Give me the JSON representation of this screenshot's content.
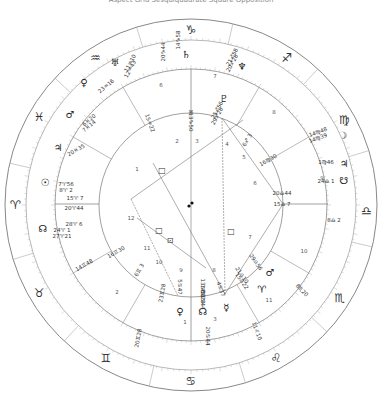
{
  "title": "Aspect Grid Sesquiquadrate Square Opposition",
  "center": {
    "x": 191,
    "y": 205
  },
  "radii": {
    "outer": 186,
    "zodiac_inner": 165,
    "house_outer": 136,
    "house_inner": 92
  },
  "colors": {
    "ring": "#888888",
    "tick": "#aaaaaa",
    "line": "#777777",
    "text": "#333333"
  },
  "signs": [
    {
      "glyph": "♑",
      "name": "capricorn",
      "angle": 90
    },
    {
      "glyph": "♐",
      "name": "sagittarius",
      "angle": 57
    },
    {
      "glyph": "♍",
      "name": "virgo",
      "angle": 29
    },
    {
      "glyph": "♎",
      "name": "libra",
      "angle": -2
    },
    {
      "glyph": "♏",
      "name": "scorpio",
      "angle": -32
    },
    {
      "glyph": "♌",
      "name": "leo",
      "angle": -61
    },
    {
      "glyph": "♋",
      "name": "cancer",
      "angle": -90
    },
    {
      "glyph": "♊",
      "name": "gemini",
      "angle": -119
    },
    {
      "glyph": "♉",
      "name": "taurus",
      "angle": -150
    },
    {
      "glyph": "♈",
      "name": "aries",
      "angle": 180
    },
    {
      "glyph": "♓",
      "name": "pisces",
      "angle": 150
    },
    {
      "glyph": "♒",
      "name": "aquarius",
      "angle": 123
    }
  ],
  "planets": [
    {
      "glyph": "♄",
      "name": "saturn",
      "x": 186,
      "y": 54,
      "labels": [
        "14♑58"
      ],
      "lx": 178,
      "ly": 40,
      "rot": -90
    },
    {
      "glyph": "♆",
      "name": "neptune",
      "x": 242,
      "y": 66,
      "labels": [
        "21♐58",
        "20♐28"
      ],
      "lx": 232,
      "ly": 57,
      "rot": -62
    },
    {
      "glyph": "♇",
      "name": "pluto",
      "x": 224,
      "y": 98,
      "labels": [
        "25♐56",
        "29♐28"
      ],
      "lx": 217,
      "ly": 110,
      "rot": -62
    },
    {
      "glyph": "♅",
      "name": "uranus",
      "x": 115,
      "y": 62,
      "labels": [
        "11♒10",
        "12♒43"
      ],
      "lx": 130,
      "ly": 63,
      "rot": -62
    },
    {
      "glyph": "♀",
      "name": "venus",
      "x": 84,
      "y": 82,
      "labels": [
        "23♒16"
      ],
      "lx": 106,
      "ly": 86,
      "rot": -40
    },
    {
      "glyph": "♂",
      "name": "mars",
      "x": 70,
      "y": 114,
      "labels": [
        "6♓20",
        "7♓14"
      ],
      "lx": 89,
      "ly": 120,
      "rot": -40
    },
    {
      "glyph": "♃",
      "name": "jupiter",
      "x": 58,
      "y": 147,
      "labels": [
        "20♓35"
      ],
      "lx": 76,
      "ly": 150,
      "rot": -30
    },
    {
      "glyph": "☉",
      "name": "sun",
      "x": 45,
      "y": 182,
      "labels": [
        "7♈56",
        "8♈ 2"
      ],
      "lx": 66,
      "ly": 184,
      "rot": 0
    },
    {
      "glyph": "☊",
      "name": "north-node",
      "x": 43,
      "y": 228,
      "labels": [
        "24♈ 1",
        "27♈21"
      ],
      "lx": 62,
      "ly": 230,
      "rot": 0
    },
    {
      "glyph": "☽",
      "name": "moon",
      "x": 343,
      "y": 135,
      "labels": [
        "14♍48",
        "14♍39"
      ],
      "lx": 318,
      "ly": 132,
      "rot": -20
    },
    {
      "glyph": "♃",
      "name": "jupiter-r",
      "x": 344,
      "y": 163,
      "labels": [
        "1♍46"
      ],
      "lx": 326,
      "ly": 162,
      "rot": 0
    },
    {
      "glyph": "☋",
      "name": "south-node",
      "x": 344,
      "y": 180,
      "labels": [
        "24♎ 1"
      ],
      "lx": 326,
      "ly": 181,
      "rot": 0
    },
    {
      "glyph": "♂",
      "name": "mars-r",
      "x": 270,
      "y": 272,
      "labels": [
        "29♎56"
      ],
      "lx": 256,
      "ly": 262,
      "rot": 55
    },
    {
      "glyph": "♈",
      "name": "aries-point",
      "x": 262,
      "y": 289,
      "labels": [
        "21♎10",
        "15♎22"
      ],
      "lx": 242,
      "ly": 275,
      "rot": 55
    },
    {
      "glyph": "♀",
      "name": "venus-r",
      "x": 180,
      "y": 311,
      "labels": [
        "5♋47"
      ],
      "lx": 180,
      "ly": 287,
      "rot": 90
    },
    {
      "glyph": "☊",
      "name": "north-node-r",
      "x": 203,
      "y": 311,
      "labels": [
        "13♋50",
        "14♋28",
        "13♋44"
      ],
      "lx": 203,
      "ly": 288,
      "rot": 90
    },
    {
      "glyph": "☿",
      "name": "mercury",
      "x": 226,
      "y": 307,
      "labels": [
        "4♋37"
      ],
      "lx": 221,
      "ly": 289,
      "rot": 70
    }
  ],
  "inner_labels": [
    {
      "text": "♅",
      "name": "uranus-inner",
      "x": 191,
      "y": 112
    },
    {
      "text": "6♐ 3",
      "name": "cusp-5",
      "x": 247,
      "y": 140,
      "rot": -60
    },
    {
      "text": "16♍30",
      "name": "cusp-6",
      "x": 268,
      "y": 160,
      "rot": -30
    },
    {
      "text": "20♎44",
      "name": "cusp-7-node",
      "x": 282,
      "y": 193
    },
    {
      "text": "15♎ 7",
      "name": "cusp-7",
      "x": 282,
      "y": 204
    },
    {
      "text": "8♎ 2",
      "name": "outer-8",
      "x": 334,
      "y": 220
    },
    {
      "text": "15♈ 7",
      "name": "cusp-1",
      "x": 75,
      "y": 198
    },
    {
      "text": "20♈44",
      "name": "cusp-1-node",
      "x": 74,
      "y": 208
    },
    {
      "text": "28♈ 6",
      "name": "south-node-inner",
      "x": 74,
      "y": 224
    },
    {
      "text": "16♊30",
      "name": "cusp-11",
      "x": 116,
      "y": 252,
      "rot": -30
    },
    {
      "text": "14♊48",
      "name": "cusp-12-outer",
      "x": 84,
      "y": 265,
      "rot": -30
    },
    {
      "text": "6♊ 3",
      "name": "cusp-11b",
      "x": 139,
      "y": 270,
      "rot": -60
    },
    {
      "text": "23♊28",
      "name": "cusp-10b",
      "x": 162,
      "y": 293,
      "rot": -80
    },
    {
      "text": "20♊28",
      "name": "cusp-10-outer",
      "x": 138,
      "y": 338,
      "rot": -80
    },
    {
      "text": "20♋44",
      "name": "cusp-ic",
      "x": 208,
      "y": 336,
      "rot": 90
    },
    {
      "text": "11♌10",
      "name": "cusp-3",
      "x": 257,
      "y": 331,
      "rot": 70
    },
    {
      "text": "8♏20",
      "name": "cusp-8",
      "x": 302,
      "y": 290,
      "rot": 45
    },
    {
      "text": "15♒22",
      "name": "cusp-2",
      "x": 150,
      "y": 123,
      "rot": 70
    },
    {
      "text": "13♑50",
      "name": "cusp-mc",
      "x": 191,
      "y": 122,
      "rot": 90
    },
    {
      "text": "20♑44",
      "name": "cusp-mc-outer",
      "x": 163,
      "y": 52,
      "rot": -90
    }
  ],
  "house_numbers": [
    {
      "n": "1",
      "x": 137,
      "y": 169
    },
    {
      "n": "2",
      "x": 177,
      "y": 141
    },
    {
      "n": "3",
      "x": 197,
      "y": 141
    },
    {
      "n": "4",
      "x": 227,
      "y": 144
    },
    {
      "n": "5",
      "x": 244,
      "y": 157
    },
    {
      "n": "6",
      "x": 255,
      "y": 183
    },
    {
      "n": "7",
      "x": 250,
      "y": 237
    },
    {
      "n": "8",
      "x": 214,
      "y": 270
    },
    {
      "n": "9",
      "x": 181,
      "y": 270
    },
    {
      "n": "10",
      "x": 159,
      "y": 262
    },
    {
      "n": "11",
      "x": 147,
      "y": 248
    },
    {
      "n": "12",
      "x": 131,
      "y": 218
    },
    {
      "n": "3",
      "x": 215,
      "y": 319
    },
    {
      "n": "1",
      "x": 185,
      "y": 322
    },
    {
      "n": "2",
      "x": 117,
      "y": 292
    },
    {
      "n": "11",
      "x": 269,
      "y": 300
    },
    {
      "n": "10",
      "x": 304,
      "y": 251
    },
    {
      "n": "9",
      "x": 322,
      "y": 178
    },
    {
      "n": "8",
      "x": 274,
      "y": 112
    },
    {
      "n": "7",
      "x": 215,
      "y": 76
    },
    {
      "n": "6",
      "x": 161,
      "y": 85
    }
  ],
  "aspects": [
    {
      "glyph": "□",
      "name": "square-aspect-1",
      "x": 162,
      "y": 170
    },
    {
      "glyph": "□",
      "name": "square-aspect-2",
      "x": 231,
      "y": 231
    },
    {
      "glyph": "□",
      "name": "square-aspect-3",
      "x": 159,
      "y": 230
    },
    {
      "glyph": "⊡",
      "name": "sesquiquadrate-aspect",
      "x": 170,
      "y": 240
    }
  ],
  "aspect_lines": [
    [
      191,
      112,
      191,
      297
    ],
    [
      131,
      199,
      243,
      120
    ],
    [
      131,
      199,
      178,
      296
    ],
    [
      222,
      118,
      283,
      204
    ],
    [
      283,
      204,
      225,
      294
    ],
    [
      222,
      118,
      225,
      294
    ],
    [
      153,
      163,
      225,
      294
    ],
    [
      137,
      218,
      206,
      268
    ]
  ],
  "house_cusps": [
    [
      99,
      204,
      55,
      204
    ],
    [
      283,
      204,
      328,
      204
    ],
    [
      191,
      113,
      191,
      69
    ],
    [
      191,
      297,
      191,
      341
    ]
  ]
}
